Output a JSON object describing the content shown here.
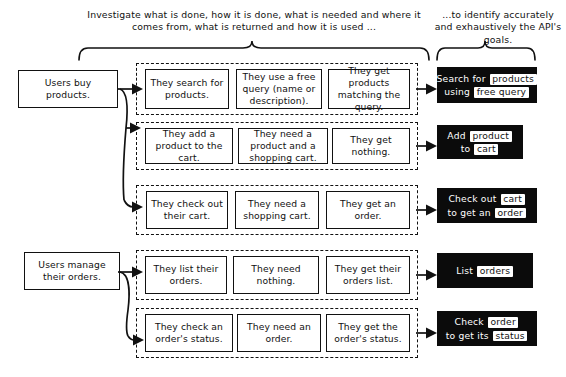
{
  "captions": {
    "left": "Investigate what is done, how it is done, what is needed and where it comes from, what is returned and how it is used ...",
    "right": "...to identify accurately and exhaustively the API's goals."
  },
  "actors": [
    {
      "id": "actor-buy",
      "label": "Users buy products."
    },
    {
      "id": "actor-manage",
      "label": "Users manage their orders."
    }
  ],
  "rows": [
    {
      "id": "row-search",
      "actor": "actor-buy",
      "steps": [
        "They search for products.",
        "They use a free query (name or description).",
        "They get products matching the query."
      ],
      "goal": {
        "lines": [
          [
            {
              "t": "Search for ",
              "hl": false
            },
            {
              "t": "products",
              "hl": true
            }
          ],
          [
            {
              "t": "using ",
              "hl": false
            },
            {
              "t": "free query",
              "hl": true
            }
          ]
        ]
      }
    },
    {
      "id": "row-add",
      "actor": "actor-buy",
      "steps": [
        "They add a product to the cart.",
        "They need a product and a shopping cart.",
        "They get nothing."
      ],
      "goal": {
        "lines": [
          [
            {
              "t": "Add ",
              "hl": false
            },
            {
              "t": "product",
              "hl": true
            }
          ],
          [
            {
              "t": "to ",
              "hl": false
            },
            {
              "t": "cart",
              "hl": true
            }
          ]
        ]
      }
    },
    {
      "id": "row-checkout",
      "actor": "actor-buy",
      "steps": [
        "They check out their cart.",
        "They need a shopping cart.",
        "They get an order."
      ],
      "goal": {
        "lines": [
          [
            {
              "t": "Check out ",
              "hl": false
            },
            {
              "t": "cart",
              "hl": true
            }
          ],
          [
            {
              "t": "to get an ",
              "hl": false
            },
            {
              "t": "order",
              "hl": true
            }
          ]
        ]
      }
    },
    {
      "id": "row-list",
      "actor": "actor-manage",
      "steps": [
        "They list their orders.",
        "They need nothing.",
        "They get their orders list."
      ],
      "goal": {
        "lines": [
          [
            {
              "t": "List ",
              "hl": false
            },
            {
              "t": "orders",
              "hl": true
            }
          ]
        ]
      }
    },
    {
      "id": "row-status",
      "actor": "actor-manage",
      "steps": [
        "They check an order's status.",
        "They need an order.",
        "They get the order's status."
      ],
      "goal": {
        "lines": [
          [
            {
              "t": "Check ",
              "hl": false
            },
            {
              "t": "order",
              "hl": true
            }
          ],
          [
            {
              "t": "to get its ",
              "hl": false
            },
            {
              "t": "status",
              "hl": true
            }
          ]
        ]
      }
    }
  ],
  "colors": {
    "ink": "#111111",
    "paper": "#ffffff",
    "goal_background": "#0b0b0b",
    "goal_text": "#ffffff",
    "highlight_background": "#ffffff"
  }
}
